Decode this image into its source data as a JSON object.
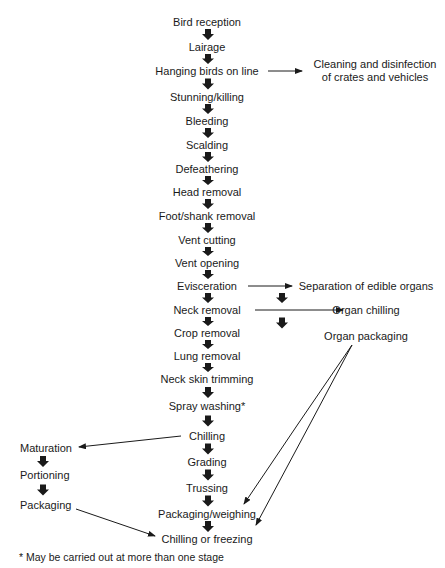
{
  "diagram": {
    "type": "flowchart",
    "title_partial": "Figure: Poultry processing steps",
    "main_steps": [
      {
        "label": "Bird reception",
        "x": 207,
        "y": 16
      },
      {
        "label": "Lairage",
        "x": 207,
        "y": 41
      },
      {
        "label": "Hanging birds on line",
        "x": 207,
        "y": 65
      },
      {
        "label": "Stunning/killing",
        "x": 207,
        "y": 91
      },
      {
        "label": "Bleeding",
        "x": 207,
        "y": 115
      },
      {
        "label": "Scalding",
        "x": 207,
        "y": 139
      },
      {
        "label": "Defeathering",
        "x": 207,
        "y": 163
      },
      {
        "label": "Head removal",
        "x": 207,
        "y": 186
      },
      {
        "label": "Foot/shank removal",
        "x": 207,
        "y": 210
      },
      {
        "label": "Vent cutting",
        "x": 207,
        "y": 234
      },
      {
        "label": "Vent opening",
        "x": 207,
        "y": 257
      },
      {
        "label": "Evisceration",
        "x": 207,
        "y": 280
      },
      {
        "label": "Neck removal",
        "x": 207,
        "y": 304
      },
      {
        "label": "Crop removal",
        "x": 207,
        "y": 327
      },
      {
        "label": "Lung removal",
        "x": 207,
        "y": 350
      },
      {
        "label": "Neck skin trimming",
        "x": 207,
        "y": 373
      },
      {
        "label": "Spray washing*",
        "x": 207,
        "y": 400
      },
      {
        "label": "Chilling",
        "x": 207,
        "y": 430
      },
      {
        "label": "Grading",
        "x": 207,
        "y": 456
      },
      {
        "label": "Trussing",
        "x": 207,
        "y": 482
      },
      {
        "label": "Packaging/weighing",
        "x": 207,
        "y": 508
      },
      {
        "label": "Chilling or freezing",
        "x": 207,
        "y": 533
      }
    ],
    "side_cleaning": {
      "line1": "Cleaning and disinfection",
      "line2": "of crates and vehicles",
      "x": 375,
      "y": 58
    },
    "organ_branch": [
      {
        "label": "Separation of edible organs",
        "x": 366,
        "y": 280
      },
      {
        "label": "Organ chilling",
        "x": 366,
        "y": 304
      },
      {
        "label": "Organ packaging",
        "x": 366,
        "y": 330
      }
    ],
    "left_branch": [
      {
        "label": "Maturation",
        "x": 20,
        "y": 442
      },
      {
        "label": "Portioning",
        "x": 20,
        "y": 469
      },
      {
        "label": "Packaging",
        "x": 20,
        "y": 499
      }
    ],
    "footnote": "* May be carried out at more than one stage",
    "colors": {
      "ink": "#1a1a1a",
      "background": "#ffffff"
    }
  }
}
